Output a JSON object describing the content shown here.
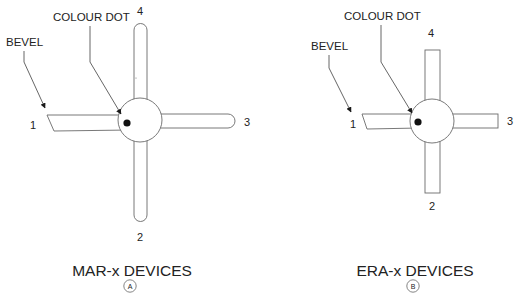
{
  "diagram": {
    "colors": {
      "background": "#ffffff",
      "outline": "#6a6a6a",
      "text": "#222222",
      "colour_dot": "#111111"
    },
    "panels": [
      {
        "id": "A",
        "title": "MAR-x DEVICES",
        "badge": "A",
        "arm_style": "rounded",
        "callouts": {
          "bevel": "BEVEL",
          "colour_dot": "COLOUR DOT"
        },
        "pins": {
          "p1": "1",
          "p2": "2",
          "p3": "3",
          "p4": "4"
        }
      },
      {
        "id": "B",
        "title": "ERA-x DEVICES",
        "badge": "B",
        "arm_style": "square",
        "callouts": {
          "bevel": "BEVEL",
          "colour_dot": "COLOUR DOT"
        },
        "pins": {
          "p1": "1",
          "p2": "2",
          "p3": "3",
          "p4": "4"
        }
      }
    ]
  }
}
